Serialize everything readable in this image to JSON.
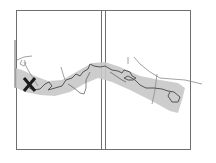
{
  "map": {
    "type": "route-corridor-map",
    "panels": 2,
    "colors": {
      "frame": "#6e6e6e",
      "corridor": "#c8c8c8",
      "route": "#555555",
      "secondary_lines": "#8a8a8a",
      "marker": "#1a1a1a",
      "background": "#ffffff"
    },
    "marker": {
      "symbol": "X",
      "label": "start-marker"
    }
  }
}
